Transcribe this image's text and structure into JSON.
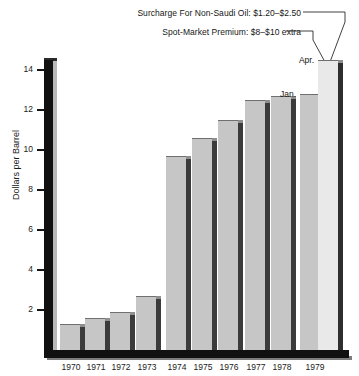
{
  "chart_data": {
    "type": "bar",
    "title": "",
    "subtitle": "",
    "xlabel": "",
    "ylabel": "Dollars per Barrel",
    "ylim": [
      0,
      15.4
    ],
    "yticks": [
      2,
      4,
      6,
      8,
      10,
      12,
      14
    ],
    "ytick_labels": [
      "2",
      "4",
      "6",
      "8",
      "10",
      "12",
      "14"
    ],
    "grid": false,
    "legend": "none",
    "categories": [
      "1970",
      "1971",
      "1972",
      "1973",
      "1974",
      "1975",
      "1976",
      "1977",
      "1978",
      "1979"
    ],
    "values": [
      1.3,
      1.6,
      1.9,
      2.7,
      9.7,
      10.6,
      11.5,
      12.5,
      12.7,
      14.5
    ],
    "bars": [
      {
        "year": "1970",
        "value": 1.3,
        "sublabel": "",
        "style": "shaded"
      },
      {
        "year": "1971",
        "value": 1.6,
        "sublabel": "",
        "style": "shaded"
      },
      {
        "year": "1972",
        "value": 1.9,
        "sublabel": "",
        "style": "shaded"
      },
      {
        "year": "1973",
        "value": 2.7,
        "sublabel": "",
        "style": "shaded"
      },
      {
        "year": "1974",
        "value": 9.7,
        "sublabel": "",
        "style": "shaded"
      },
      {
        "year": "1975",
        "value": 10.6,
        "sublabel": "",
        "style": "shaded"
      },
      {
        "year": "1976",
        "value": 11.5,
        "sublabel": "",
        "style": "shaded"
      },
      {
        "year": "1977",
        "value": 12.5,
        "sublabel": "",
        "style": "shaded"
      },
      {
        "year": "1978",
        "value": 12.7,
        "sublabel": "",
        "style": "shaded"
      },
      {
        "year": "1979",
        "value": 12.8,
        "sublabel": "Jan.",
        "style": "shaded"
      },
      {
        "year": "1979",
        "value": 14.5,
        "sublabel": "Apr.",
        "style": "light"
      }
    ],
    "annotations": [
      {
        "id": "surcharge",
        "text": "Surcharge For Non-Saudi Oil:  $1.20–$2.50"
      },
      {
        "id": "spot",
        "text": "Spot-Market Premium:  $8–$10 extra"
      }
    ]
  },
  "axis": {
    "y_title": "Dollars per Barrel",
    "tick_labels": [
      "14",
      "12",
      "10",
      "8",
      "6",
      "4",
      "2"
    ],
    "year_labels": [
      "1970",
      "1971",
      "1972",
      "1973",
      "1974",
      "1975",
      "1976",
      "1977",
      "1978",
      "1979"
    ]
  },
  "annotations": {
    "surcharge_label": "Surcharge For Non-Saudi Oil:  $1.20–$2.50",
    "spot_label": "Spot-Market Premium:  $8–$10 extra",
    "jan_label": "Jan.",
    "apr_label": "Apr."
  },
  "colors": {
    "bar_face": "#c6c6c6",
    "bar_face_light": "#e9e9e9",
    "bar_side": "#3b3b3b",
    "axis": "#111111",
    "background": "#ffffff",
    "text": "#1a1a1a"
  }
}
